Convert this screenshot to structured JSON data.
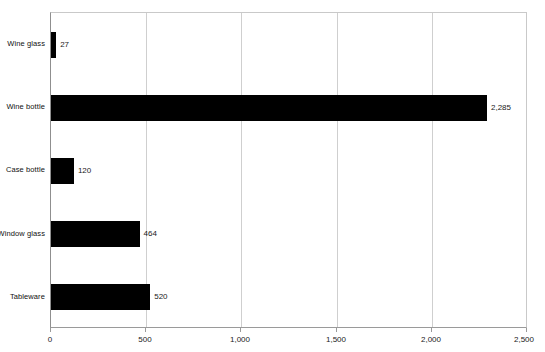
{
  "chart_data": {
    "type": "bar",
    "orientation": "horizontal",
    "title": "",
    "xlabel": "",
    "ylabel": "",
    "xlim": [
      0,
      2500
    ],
    "grid": true,
    "legend": false,
    "categories": [
      "Wine glass",
      "Wine bottle",
      "Case bottle",
      "Window glass",
      "Tableware"
    ],
    "values": [
      27,
      2285,
      120,
      464,
      520
    ],
    "data_labels": [
      "27",
      "2,285",
      "120",
      "464",
      "520"
    ],
    "xticks": [
      0,
      500,
      1000,
      1500,
      2000,
      2500
    ],
    "xtick_labels": [
      "0",
      "500",
      "1,000",
      "1,500",
      "2,000",
      "2,500"
    ],
    "bar_color": "#000000"
  },
  "axis": {
    "ticks": [
      {
        "value": 0,
        "label": "0"
      },
      {
        "value": 500,
        "label": "500"
      },
      {
        "value": 1000,
        "label": "1,000"
      },
      {
        "value": 1500,
        "label": "1,500"
      },
      {
        "value": 2000,
        "label": "2,000"
      },
      {
        "value": 2500,
        "label": "2,500"
      }
    ]
  },
  "series": [
    {
      "category": "Wine glass",
      "value": 27,
      "label": "27"
    },
    {
      "category": "Wine bottle",
      "value": 2285,
      "label": "2,285"
    },
    {
      "category": "Case bottle",
      "value": 120,
      "label": "120"
    },
    {
      "category": "Window glass",
      "value": 464,
      "label": "464"
    },
    {
      "category": "Tableware",
      "value": 520,
      "label": "520"
    }
  ]
}
